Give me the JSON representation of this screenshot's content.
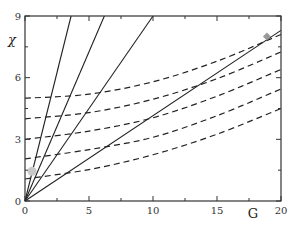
{
  "chart_data": {
    "type": "line",
    "title": "",
    "xlabel": "G",
    "ylabel": "χ",
    "xlim": [
      0,
      20
    ],
    "ylim": [
      0,
      9
    ],
    "x_ticks": [
      0,
      5,
      10,
      15,
      20
    ],
    "x_minor_ticks": [
      2.5,
      7.5,
      12.5,
      17.5
    ],
    "y_ticks": [
      0,
      3,
      6,
      9
    ],
    "y_minor_ticks": [
      1.5,
      4.5,
      7.5
    ],
    "grid": false,
    "legend": null,
    "solid_lines": [
      {
        "name": "line-1",
        "style": "solid",
        "slope": 2.5,
        "x": [
          0,
          3.6
        ],
        "y": [
          0,
          9
        ]
      },
      {
        "name": "line-2",
        "style": "solid",
        "slope": 1.45,
        "x": [
          0,
          6.2
        ],
        "y": [
          0,
          9
        ]
      },
      {
        "name": "line-3",
        "style": "solid",
        "slope": 0.9,
        "x": [
          0,
          10.0
        ],
        "y": [
          0,
          9
        ]
      },
      {
        "name": "line-4",
        "style": "solid",
        "slope": 0.415,
        "x": [
          0,
          20
        ],
        "y": [
          0,
          8.3
        ]
      }
    ],
    "dashed_curves": [
      {
        "name": "curve-1",
        "style": "dashed",
        "x": [
          0,
          5,
          10,
          15,
          20
        ],
        "y": [
          5.0,
          5.2,
          5.8,
          6.8,
          8.1
        ]
      },
      {
        "name": "curve-2",
        "style": "dashed",
        "x": [
          0,
          5,
          10,
          15,
          20
        ],
        "y": [
          4.0,
          4.3,
          4.95,
          5.95,
          7.25
        ]
      },
      {
        "name": "curve-3",
        "style": "dashed",
        "x": [
          0,
          5,
          10,
          15,
          20
        ],
        "y": [
          3.0,
          3.4,
          4.05,
          5.1,
          6.4
        ]
      },
      {
        "name": "curve-4",
        "style": "dashed",
        "x": [
          0,
          5,
          10,
          15,
          20
        ],
        "y": [
          2.05,
          2.5,
          3.1,
          4.15,
          5.45
        ]
      },
      {
        "name": "curve-5",
        "style": "dashed",
        "x": [
          0,
          5,
          10,
          15,
          20
        ],
        "y": [
          1.07,
          1.53,
          2.25,
          3.25,
          4.5
        ]
      }
    ],
    "markers": [
      {
        "name": "grey-dot",
        "shape": "circle",
        "x": 0.55,
        "y": 1.45,
        "color": "#c8c8c8"
      },
      {
        "name": "grey-diamond",
        "shape": "diamond",
        "x": 18.9,
        "y": 8.0,
        "color": "#999999"
      }
    ]
  },
  "axes": {
    "x_label": "G",
    "y_label": "χ",
    "x_tick_labels": [
      "0",
      "5",
      "10",
      "15",
      "20"
    ],
    "y_tick_labels": [
      "0",
      "3",
      "6",
      "9"
    ]
  }
}
